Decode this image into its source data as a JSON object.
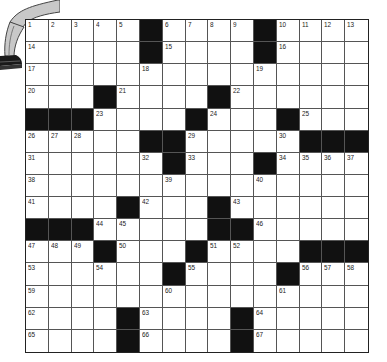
{
  "puzzle": {
    "rows": 15,
    "cols": 15,
    "grid": [
      [
        "1",
        "2",
        "3",
        "4",
        "5",
        "#",
        "6",
        "7",
        "8",
        "9",
        "#",
        "10",
        "11",
        "12",
        "13"
      ],
      [
        "14",
        "",
        "",
        "",
        "",
        "#",
        "15",
        "",
        "",
        "",
        "#",
        "16",
        "",
        "",
        ""
      ],
      [
        "17",
        "",
        "",
        "",
        "",
        "18",
        "",
        "",
        "",
        "",
        "19",
        "",
        "",
        "",
        ""
      ],
      [
        "20",
        "",
        "",
        "#",
        "21",
        "",
        "",
        "",
        "#",
        "22",
        "",
        "",
        "",
        "",
        ""
      ],
      [
        "#",
        "#",
        "#",
        "23",
        "",
        "",
        "",
        "#",
        "24",
        "",
        "",
        "#",
        "25",
        "",
        ""
      ],
      [
        "26",
        "27",
        "28",
        "",
        "",
        "#",
        "#",
        "29",
        "",
        "",
        "",
        "30",
        "#",
        "#",
        "#"
      ],
      [
        "31",
        "",
        "",
        "",
        "",
        "32",
        "#",
        "33",
        "",
        "",
        "#",
        "34",
        "35",
        "36",
        "37"
      ],
      [
        "38",
        "",
        "",
        "",
        "",
        "",
        "39",
        "",
        "",
        "",
        "40",
        "",
        "",
        "",
        ""
      ],
      [
        "41",
        "",
        "",
        "",
        "#",
        "42",
        "",
        "",
        "#",
        "43",
        "",
        "",
        "",
        "",
        ""
      ],
      [
        "#",
        "#",
        "#",
        "44",
        "45",
        "",
        "",
        "",
        "#",
        "#",
        "46",
        "",
        "",
        "",
        ""
      ],
      [
        "47",
        "48",
        "49",
        "#",
        "50",
        "",
        "",
        "#",
        "51",
        "52",
        "",
        "",
        "#",
        "#",
        "#"
      ],
      [
        "53",
        "",
        "",
        "54",
        "",
        "",
        "#",
        "55",
        "",
        "",
        "",
        "#",
        "56",
        "57",
        "58"
      ],
      [
        "59",
        "",
        "",
        "",
        "",
        "",
        "60",
        "",
        "",
        "",
        "",
        "61",
        "",
        "",
        ""
      ],
      [
        "62",
        "",
        "",
        "",
        "#",
        "63",
        "",
        "",
        "",
        "#",
        "64",
        "",
        "",
        "",
        ""
      ],
      [
        "65",
        "",
        "",
        "",
        "#",
        "66",
        "",
        "",
        "",
        "#",
        "67",
        "",
        "",
        "",
        ""
      ]
    ]
  },
  "colors": {
    "black_cell": "#111111",
    "grid_line": "#555555",
    "pants": "#c8c8c8",
    "shoe": "#1a1a1a"
  },
  "decoration": {
    "icon": "cartoon-legs-sitting-on-grid"
  }
}
